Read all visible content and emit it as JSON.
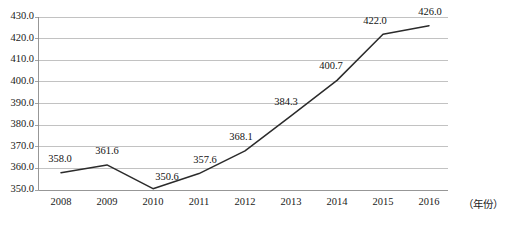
{
  "chart_data": {
    "type": "line",
    "title": "",
    "subtitle": "",
    "xlabel": "（年份）",
    "ylabel": "",
    "categories": [
      "2008",
      "2009",
      "2010",
      "2011",
      "2012",
      "2013",
      "2014",
      "2015",
      "2016"
    ],
    "x": [
      2008,
      2009,
      2010,
      2011,
      2012,
      2013,
      2014,
      2015,
      2016
    ],
    "values": [
      358.0,
      361.6,
      350.6,
      357.6,
      368.1,
      384.3,
      400.7,
      422.0,
      426.0
    ],
    "point_labels": [
      "358.0",
      "361.6",
      "350.6",
      "357.6",
      "368.1",
      "384.3",
      "400.7",
      "422.0",
      "426.0"
    ],
    "ylim": [
      350.0,
      430.0
    ],
    "yticks": [
      350.0,
      360.0,
      370.0,
      380.0,
      390.0,
      400.0,
      410.0,
      420.0,
      430.0
    ],
    "ytick_labels": [
      "350.0",
      "360.0",
      "370.0",
      "380.0",
      "390.0",
      "400.0",
      "410.0",
      "420.0",
      "430.0"
    ],
    "grid": true,
    "grid_axis": "y",
    "legend": false,
    "legend_position": "none",
    "series": [
      {
        "name": "",
        "values": [
          358.0,
          361.6,
          350.6,
          357.6,
          368.1,
          384.3,
          400.7,
          422.0,
          426.0
        ]
      }
    ],
    "annotations": [
      {
        "label": "358.0",
        "x": 2008,
        "y": 358.0
      },
      {
        "label": "361.6",
        "x": 2009,
        "y": 361.6
      },
      {
        "label": "350.6",
        "x": 2010,
        "y": 350.6
      },
      {
        "label": "357.6",
        "x": 2011,
        "y": 357.6
      },
      {
        "label": "368.1",
        "x": 2012,
        "y": 368.1
      },
      {
        "label": "384.3",
        "x": 2013,
        "y": 384.3
      },
      {
        "label": "400.7",
        "x": 2014,
        "y": 400.7
      },
      {
        "label": "422.0",
        "x": 2015,
        "y": 422.0
      },
      {
        "label": "426.0",
        "x": 2016,
        "y": 426.0
      }
    ],
    "colors": {
      "line": "#2b2b2b",
      "grid": "#b3b3b3",
      "axis": "#8c8c8c",
      "text": "#1a1a1a",
      "background": "#ffffff"
    }
  }
}
